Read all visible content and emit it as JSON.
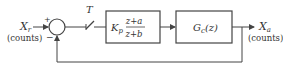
{
  "diagram": {
    "type": "block-diagram",
    "input": {
      "symbol": "X",
      "subscript": "r",
      "unit": "(counts)"
    },
    "output": {
      "symbol": "X",
      "subscript": "a",
      "unit": "(counts)"
    },
    "summing_junction": {
      "plus_sign": "+",
      "minus_sign": "−"
    },
    "sampler": {
      "label": "T"
    },
    "controller": {
      "gain": "K",
      "gain_subscript": "p",
      "numerator": "z+a",
      "denominator": "z+b"
    },
    "plant": {
      "symbol": "G",
      "subscript": "c",
      "argument": "(z)"
    },
    "colors": {
      "line": "#444444",
      "text": "#333333",
      "background": "#ffffff"
    }
  }
}
